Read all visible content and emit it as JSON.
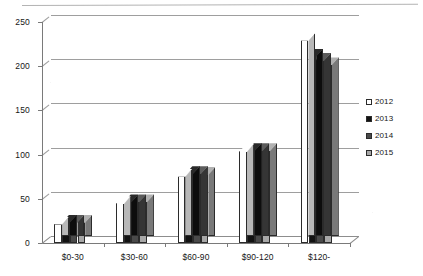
{
  "chart_data": {
    "type": "bar",
    "title": "",
    "subtitle": "",
    "xlabel": "",
    "ylabel": "",
    "categories": [
      "$0-30",
      "$30-60",
      "$60-90",
      "$90-120",
      "$120-"
    ],
    "series": [
      {
        "name": "2012",
        "values": [
          22,
          45,
          76,
          104,
          230
        ],
        "color": "#ffffff"
      },
      {
        "name": "2013",
        "values": [
          24,
          47,
          79,
          105,
          212
        ],
        "color": "#121212"
      },
      {
        "name": "2014",
        "values": [
          24,
          47,
          79,
          105,
          207
        ],
        "color": "#4a4a4a"
      },
      {
        "name": "2015",
        "values": [
          24,
          47,
          78,
          105,
          202
        ],
        "color": "#a8a8a8"
      }
    ],
    "ylim": [
      0,
      250
    ],
    "yticks": [
      0,
      50,
      100,
      150,
      200,
      250
    ],
    "ytick_labels": [
      "0",
      "50",
      "100",
      "150",
      "200",
      "250"
    ],
    "grid": true,
    "legend_position": "right",
    "style": "3d-column"
  },
  "legend": {
    "entries": [
      {
        "label": "2012",
        "color": "#ffffff"
      },
      {
        "label": "2013",
        "color": "#121212"
      },
      {
        "label": "2014",
        "color": "#4a4a4a"
      },
      {
        "label": "2015",
        "color": "#a8a8a8"
      }
    ]
  },
  "axes": {
    "y_tick_labels": [
      "250",
      "200",
      "150",
      "100",
      "50",
      "0"
    ],
    "x_tick_labels": [
      "$0-30",
      "$30-60",
      "$60-90",
      "$90-120",
      "$120-"
    ]
  },
  "colors": {
    "axis": "#7a7a7a",
    "grid": "#8d8d8d",
    "text": "#161616",
    "bar_outline": "#2b2b2b"
  }
}
